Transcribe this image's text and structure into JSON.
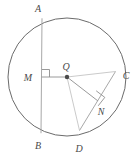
{
  "figure": {
    "type": "geometry-diagram",
    "width": 138,
    "height": 157,
    "background_color": "#ffffff",
    "stroke_color": "#6b6b6b",
    "chord_color": "#9a9a9a",
    "label_color": "#4a4a4a"
  },
  "circle": {
    "name": "circle-q",
    "center_label": "Q",
    "center_x": 67,
    "center_y": 77,
    "radius": 59
  },
  "points": {
    "A": {
      "label": "A",
      "x": 42,
      "y": 18,
      "label_x": 38,
      "label_y": 12
    },
    "B": {
      "label": "B",
      "x": 41,
      "y": 133,
      "label_x": 37,
      "label_y": 148
    },
    "C": {
      "label": "C",
      "x": 115,
      "y": 72,
      "label_x": 124,
      "label_y": 77
    },
    "D": {
      "label": "D",
      "x": 80,
      "y": 130,
      "label_x": 78,
      "label_y": 150
    },
    "M": {
      "label": "M",
      "x": 42,
      "y": 77,
      "label_x": 26,
      "label_y": 81
    },
    "N": {
      "label": "N",
      "x": 98,
      "y": 101,
      "label_x": 100,
      "label_y": 113
    },
    "Q": {
      "label": "Q",
      "x": 67,
      "y": 77,
      "label_x": 63,
      "label_y": 70
    }
  },
  "segments": [
    {
      "name": "chord-ab",
      "from": "A",
      "to": "B"
    },
    {
      "name": "chord-cd",
      "from": "C",
      "to": "D"
    },
    {
      "name": "radius-qm",
      "from": "Q",
      "to": "M"
    },
    {
      "name": "radius-qn",
      "from": "Q",
      "to": "N"
    },
    {
      "name": "radius-qc",
      "from": "Q",
      "to": "C"
    },
    {
      "name": "radius-qd",
      "from": "Q",
      "to": "D"
    }
  ],
  "right_angles": [
    {
      "name": "right-angle-m",
      "at": "M",
      "size": 8
    },
    {
      "name": "right-angle-n",
      "at": "N",
      "size": 8
    }
  ],
  "labels": {
    "a": "A",
    "b": "B",
    "c": "C",
    "d": "D",
    "m": "M",
    "n": "N",
    "q": "Q"
  }
}
